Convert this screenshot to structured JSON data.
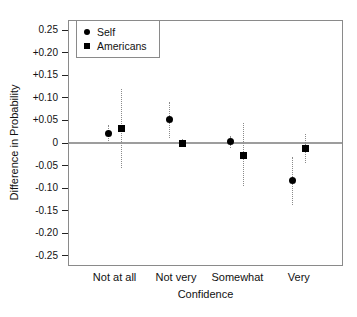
{
  "chart_data": {
    "type": "scatter",
    "title": "",
    "xlabel": "Confidence",
    "ylabel": "Difference in Probability",
    "categories": [
      "Not at all",
      "Not very",
      "Somewhat",
      "Very"
    ],
    "ylim": [
      -0.27,
      0.27
    ],
    "ytick_values": [
      0.25,
      0.2,
      0.15,
      0.1,
      0.05,
      0,
      -0.05,
      -0.1,
      -0.15,
      -0.2,
      -0.25
    ],
    "ytick_labels": [
      "0.25",
      "+0.20",
      "+0.15",
      "+0.10",
      "+0.05",
      "0",
      "-0.05",
      "-0.10",
      "-0.15",
      "-0.20",
      "-0.25"
    ],
    "legend": [
      "Self",
      "Americans"
    ],
    "legend_position": "top-left",
    "grid": false,
    "zero_reference_line": 0,
    "series": [
      {
        "name": "Self",
        "marker": "circle",
        "values": [
          0.022,
          0.052,
          0.003,
          -0.082
        ],
        "ci_low": [
          0.005,
          0.012,
          -0.012,
          -0.138
        ],
        "ci_high": [
          0.04,
          0.09,
          0.015,
          -0.032
        ]
      },
      {
        "name": "Americans",
        "marker": "square",
        "values": [
          0.033,
          0.0,
          -0.027,
          -0.013
        ],
        "ci_low": [
          -0.055,
          -0.008,
          -0.095,
          -0.045
        ],
        "ci_high": [
          0.12,
          0.008,
          0.045,
          0.02
        ]
      }
    ],
    "colors": {
      "point": "#000000",
      "error_bar": "#8a8a8a",
      "zero_line": "#9d9d9d",
      "frame": "#8a8a8a",
      "text": "#111111",
      "background": "#ffffff"
    }
  }
}
